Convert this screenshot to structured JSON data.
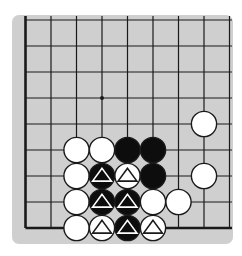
{
  "diagram": {
    "type": "go-board-fragment",
    "visible_columns": 9,
    "visible_rows": 9,
    "edges": {
      "left": true,
      "bottom": true,
      "top": false,
      "right": false
    },
    "colors": {
      "board": "#cfcfcf",
      "line": "#1a1a1a",
      "black_stone": "#0d0d0d",
      "white_stone": "#ffffff",
      "stone_outline": "#1a1a1a",
      "page": "#ffffff"
    },
    "star_point": {
      "col": 3,
      "row": 3
    },
    "stones": [
      {
        "col": 7,
        "row": 4,
        "color": "white",
        "marker": ""
      },
      {
        "col": 2,
        "row": 5,
        "color": "white",
        "marker": ""
      },
      {
        "col": 3,
        "row": 5,
        "color": "white",
        "marker": ""
      },
      {
        "col": 4,
        "row": 5,
        "color": "black",
        "marker": ""
      },
      {
        "col": 5,
        "row": 5,
        "color": "black",
        "marker": ""
      },
      {
        "col": 2,
        "row": 6,
        "color": "white",
        "marker": ""
      },
      {
        "col": 3,
        "row": 6,
        "color": "black",
        "marker": "triangle"
      },
      {
        "col": 4,
        "row": 6,
        "color": "white",
        "marker": "triangle"
      },
      {
        "col": 5,
        "row": 6,
        "color": "black",
        "marker": ""
      },
      {
        "col": 7,
        "row": 6,
        "color": "white",
        "marker": ""
      },
      {
        "col": 2,
        "row": 7,
        "color": "white",
        "marker": ""
      },
      {
        "col": 3,
        "row": 7,
        "color": "black",
        "marker": "triangle"
      },
      {
        "col": 4,
        "row": 7,
        "color": "black",
        "marker": "triangle"
      },
      {
        "col": 5,
        "row": 7,
        "color": "white",
        "marker": ""
      },
      {
        "col": 6,
        "row": 7,
        "color": "white",
        "marker": ""
      },
      {
        "col": 2,
        "row": 8,
        "color": "white",
        "marker": ""
      },
      {
        "col": 3,
        "row": 8,
        "color": "white",
        "marker": "triangle"
      },
      {
        "col": 4,
        "row": 8,
        "color": "black",
        "marker": "triangle"
      },
      {
        "col": 5,
        "row": 8,
        "color": "white",
        "marker": "triangle"
      }
    ]
  }
}
